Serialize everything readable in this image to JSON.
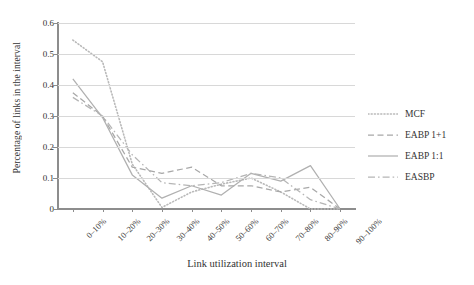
{
  "chart_data": {
    "type": "line",
    "title": "",
    "xlabel": "Link utilization interval",
    "ylabel": "Percentage of links in the interval",
    "categories": [
      "0–10%",
      "10–20%",
      "20–30%",
      "30–40%",
      "40–50%",
      "50–60%",
      "60–70%",
      "70–80%",
      "80–90%",
      "90–100%"
    ],
    "ylim": [
      0,
      0.6
    ],
    "ytick_labels": [
      "0",
      "0.1",
      "0.2",
      "0.3",
      "0.4",
      "0.5",
      "0.6"
    ],
    "ytick_values": [
      0,
      0.1,
      0.2,
      0.3,
      0.4,
      0.5,
      0.6
    ],
    "grid": "horizontal",
    "legend_position": "right",
    "series": [
      {
        "name": "MCF",
        "style": "dotted",
        "color": "#b9b9b9",
        "values": [
          0.545,
          0.475,
          0.145,
          0.005,
          0.055,
          0.08,
          0.1,
          0.055,
          0.0,
          0.0
        ]
      },
      {
        "name": "EABP 1+1",
        "style": "dashed",
        "color": "#a8a8a8",
        "values": [
          0.375,
          0.3,
          0.135,
          0.115,
          0.135,
          0.075,
          0.075,
          0.055,
          0.07,
          0.0
        ]
      },
      {
        "name": "EABP 1:1",
        "style": "solid",
        "color": "#b0b0b0",
        "values": [
          0.42,
          0.295,
          0.11,
          0.035,
          0.075,
          0.045,
          0.115,
          0.09,
          0.14,
          0.0
        ]
      },
      {
        "name": "EASBP",
        "style": "dashdot",
        "color": "#b5b5b5",
        "values": [
          0.36,
          0.3,
          0.175,
          0.085,
          0.075,
          0.085,
          0.115,
          0.1,
          0.03,
          0.0
        ]
      }
    ]
  },
  "legend": {
    "items": [
      {
        "label": "MCF"
      },
      {
        "label": "EABP 1+1"
      },
      {
        "label": "EABP 1:1"
      },
      {
        "label": "EASBP"
      }
    ]
  }
}
